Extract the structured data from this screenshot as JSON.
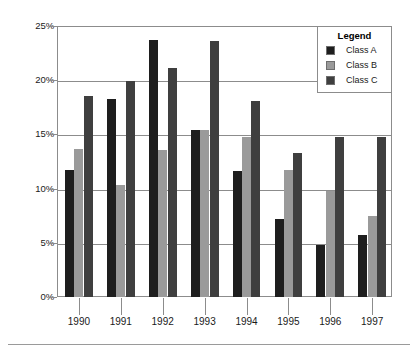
{
  "chart_data": {
    "type": "bar",
    "title": "",
    "subtitle": "",
    "xlabel": "",
    "ylabel": "",
    "ylim": [
      0,
      25
    ],
    "yunit": "%",
    "grid": true,
    "legend_position": "top-right",
    "legend_title": "Legend",
    "categories": [
      "1990",
      "1991",
      "1992",
      "1993",
      "1994",
      "1995",
      "1996",
      "1997"
    ],
    "ytick_labels": [
      "0%",
      "5%",
      "10%",
      "15%",
      "20%",
      "25%"
    ],
    "ytick_values": [
      0,
      5,
      10,
      15,
      20,
      25
    ],
    "series": [
      {
        "name": "Class A",
        "color": "#1e1e1e",
        "values": [
          11.7,
          18.3,
          23.7,
          15.4,
          11.6,
          7.2,
          4.8,
          5.7
        ]
      },
      {
        "name": "Class B",
        "color": "#9a9a9a",
        "values": [
          13.7,
          10.3,
          13.6,
          15.4,
          14.8,
          11.7,
          9.8,
          7.5
        ]
      },
      {
        "name": "Class C",
        "color": "#3f3f3f",
        "values": [
          18.5,
          19.9,
          21.1,
          23.6,
          18.1,
          13.3,
          14.8,
          14.8
        ]
      }
    ]
  },
  "colors": {
    "axis": "#8c8c8c",
    "grid": "#8c8c8c",
    "text": "#1a1a1a",
    "background": "#ffffff",
    "footer_rule": "#9a9a9a"
  }
}
